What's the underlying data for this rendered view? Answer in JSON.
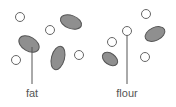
{
  "diagram": {
    "labels": {
      "fat": "fat",
      "flour": "flour"
    },
    "colors": {
      "ellipse_fill": "#8f8f8f",
      "stroke": "#555555",
      "circle_fill": "#ffffff"
    },
    "left_panel": {
      "circles": [
        [
          20,
          17
        ],
        [
          50,
          30
        ],
        [
          16,
          60
        ],
        [
          79,
          55
        ]
      ],
      "ellipses": [
        "fat-particle-1",
        "fat-particle-2",
        "fat-particle-3"
      ]
    },
    "right_panel": {
      "circles": [
        [
          146,
          14
        ],
        [
          127,
          31
        ],
        [
          112,
          42
        ],
        [
          145,
          57
        ]
      ],
      "ellipses": [
        "fat-particle-4",
        "fat-particle-5"
      ]
    }
  }
}
